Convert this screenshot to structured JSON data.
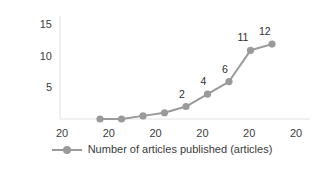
{
  "chart_data": {
    "type": "line",
    "title": "",
    "xlabel": "",
    "ylabel": "",
    "grid": false,
    "legend_position": "bottom",
    "ylim": [
      0,
      16.5
    ],
    "y_ticks": [
      5,
      10,
      15
    ],
    "y_tick_labels": [
      "5",
      "10",
      "15"
    ],
    "x_tick_labels": [
      "20",
      "20",
      "20",
      "20",
      "20",
      "20"
    ],
    "categories": [
      "20",
      "20",
      "20",
      "20",
      "20",
      "20",
      "20",
      "20",
      "20"
    ],
    "series": [
      {
        "name": "Number of articles published (articles)",
        "color": "#9a9a9a",
        "values": [
          0,
          0,
          0.5,
          1,
          2,
          4,
          6,
          11,
          12
        ],
        "point_labels": [
          "",
          "",
          "",
          "",
          "2",
          "4",
          "6",
          "11",
          "12"
        ]
      }
    ],
    "legend": [
      "Number of articles published (articles)"
    ]
  },
  "legend": {
    "label": "Number of articles published (articles)",
    "marker_icon": "line-marker-icon"
  },
  "colors": {
    "series": "#9a9a9a",
    "axis": "#e2e2e2",
    "text": "#404040",
    "background": "#ffffff"
  }
}
